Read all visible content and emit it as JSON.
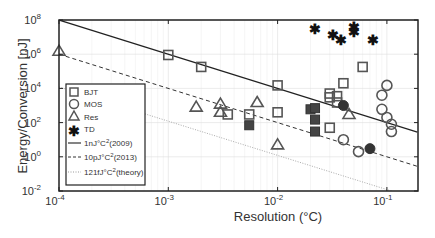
{
  "chart_data": {
    "type": "scatter",
    "title": "",
    "xlabel": "Resolution (°C)",
    "ylabel": "Energy/Conversion [nJ]",
    "xscale": "log",
    "yscale": "log",
    "xlim": [
      0.0001,
      0.19
    ],
    "ylim": [
      0.01,
      100000000
    ],
    "x_tick_labels": [
      "10^-4",
      "10^-3",
      "10^-2",
      "10^-1"
    ],
    "y_tick_labels": [
      "10^-2",
      "10^0",
      "10^2",
      "10^4",
      "10^6",
      "10^8"
    ],
    "grid": true,
    "legend_position": "lower left inside",
    "legend": [
      "BJT",
      "MOS",
      "Res",
      "TD",
      "1nJ°C^2(2009)",
      "10pJ°C^2(2013)",
      "121fJ°C^2(theory)"
    ],
    "series": [
      {
        "name": "BJT",
        "marker": "square-open",
        "points": [
          [
            0.001,
            900000
          ],
          [
            0.002,
            180000
          ],
          [
            0.01,
            15000
          ],
          [
            0.035,
            3500
          ],
          [
            0.04,
            20000
          ],
          [
            0.06,
            180000
          ],
          [
            0.03,
            5000
          ],
          [
            0.03,
            3000
          ],
          [
            0.035,
            1500
          ],
          [
            0.01,
            400
          ],
          [
            0.03,
            50
          ],
          [
            0.0035,
            300
          ],
          [
            0.0055,
            300
          ]
        ]
      },
      {
        "name": "BJT (filled)",
        "marker": "square-filled",
        "points": [
          [
            0.0055,
            70
          ],
          [
            0.02,
            600
          ],
          [
            0.022,
            700
          ],
          [
            0.022,
            150
          ],
          [
            0.022,
            30
          ]
        ]
      },
      {
        "name": "MOS",
        "marker": "circle-open",
        "points": [
          [
            0.1,
            15000
          ],
          [
            0.09,
            4000
          ],
          [
            0.09,
            600
          ],
          [
            0.1,
            200
          ],
          [
            0.11,
            80
          ],
          [
            0.11,
            30
          ],
          [
            0.04,
            10
          ],
          [
            0.055,
            2
          ]
        ]
      },
      {
        "name": "MOS (filled)",
        "marker": "circle-filled",
        "points": [
          [
            0.04,
            1000
          ],
          [
            0.07,
            3
          ]
        ]
      },
      {
        "name": "Res",
        "marker": "triangle-open",
        "points": [
          [
            0.0001,
            1500000
          ],
          [
            0.0018,
            800
          ],
          [
            0.003,
            1200
          ],
          [
            0.003,
            400
          ],
          [
            0.0065,
            1500
          ],
          [
            0.045,
            300
          ],
          [
            0.01,
            5
          ]
        ]
      },
      {
        "name": "TD",
        "marker": "asterisk",
        "points": [
          [
            0.022,
            30000000
          ],
          [
            0.032,
            13000000
          ],
          [
            0.038,
            7000000
          ],
          [
            0.05,
            40000000
          ],
          [
            0.05,
            20000000
          ],
          [
            0.075,
            7000000
          ]
        ]
      }
    ],
    "lines": [
      {
        "name": "1nJ°C^2(2009)",
        "style": "solid",
        "formula": "E = 1 / r^2 nJ"
      },
      {
        "name": "10pJ°C^2(2013)",
        "style": "dashed",
        "formula": "E = 0.01 / r^2 nJ"
      },
      {
        "name": "121fJ°C^2(theory)",
        "style": "dotted",
        "formula": "E = 0.000121 / r^2 nJ"
      }
    ]
  },
  "labels": {
    "xlabel": "Resolution (°C)",
    "ylabel": "Energy/Conversion [nJ]",
    "x_ticks": [
      {
        "base": "10",
        "exp": "-4"
      },
      {
        "base": "10",
        "exp": "-3"
      },
      {
        "base": "10",
        "exp": "-2"
      },
      {
        "base": "10",
        "exp": "-1"
      }
    ],
    "y_ticks": [
      {
        "base": "10",
        "exp": "8"
      },
      {
        "base": "10",
        "exp": "6"
      },
      {
        "base": "10",
        "exp": "4"
      },
      {
        "base": "10",
        "exp": "2"
      },
      {
        "base": "10",
        "exp": "0"
      },
      {
        "base": "10",
        "exp": "-2"
      }
    ],
    "legend": [
      "BJT",
      "MOS",
      "Res",
      "TD",
      "1nJ°C",
      "(2009)",
      "10pJ°C",
      "(2013)",
      "121fJ°C",
      "(theory)"
    ]
  }
}
